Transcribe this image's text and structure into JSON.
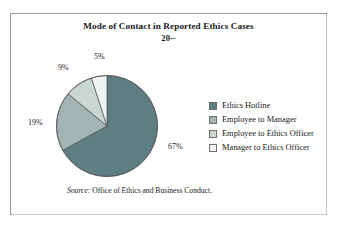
{
  "figure": {
    "title": "Mode of Contact in Reported Ethics Cases",
    "subtitle": "20--",
    "source_keyword": "Source:",
    "source_text": " Office of Ethics and Business Conduct."
  },
  "legend": {
    "items": [
      {
        "label": "Ethics Hotline",
        "color": "#5d7f84"
      },
      {
        "label": "Employee to Manager",
        "color": "#a3b5b3"
      },
      {
        "label": "Employee to Ethics Officer",
        "color": "#c9d6d2"
      },
      {
        "label": "Manager to Ethics Officer",
        "color": "#eef2f0"
      }
    ]
  },
  "labels": {
    "slice_67": "67%",
    "slice_19": "19%",
    "slice_9": "9%",
    "slice_5": "5%"
  },
  "chart_data": {
    "type": "pie",
    "title": "Mode of Contact in Reported Ethics Cases",
    "subtitle": "20--",
    "categories": [
      "Ethics Hotline",
      "Employee to Manager",
      "Employee to Ethics Officer",
      "Manager to Ethics Officer"
    ],
    "values": [
      67,
      19,
      9,
      5
    ],
    "value_labels": [
      "67%",
      "19%",
      "9%",
      "5%"
    ],
    "unit": "percent",
    "colors": [
      "#5d7f84",
      "#a3b5b3",
      "#c9d6d2",
      "#eef2f0"
    ],
    "start_angle_deg": 0,
    "direction": "clockwise",
    "legend_position": "right",
    "grid": false,
    "xlabel": "",
    "ylabel": "",
    "source": "Source: Office of Ethics and Business Conduct."
  }
}
